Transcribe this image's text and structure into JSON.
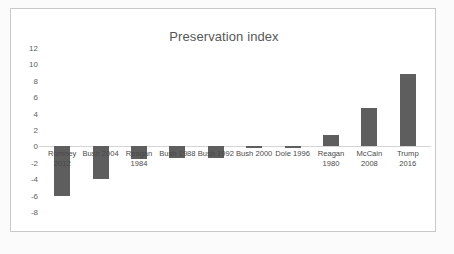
{
  "chart_data": {
    "type": "bar",
    "title": "Preservation index",
    "xlabel": "",
    "ylabel": "",
    "ylim": [
      -8,
      12
    ],
    "ytick_step": 2,
    "yticks": [
      12,
      10,
      8,
      6,
      4,
      2,
      0,
      -2,
      -4,
      -6,
      -8
    ],
    "ytick_labels": [
      "12",
      "10",
      "8",
      "6",
      "4",
      "2",
      "0",
      "-2",
      "-4",
      "-6",
      "-8"
    ],
    "grid": false,
    "legend": false,
    "bar_color": "#5e5e5e",
    "categories": [
      "Romney 2012",
      "Bush 2004",
      "Reagan 1984",
      "Bush 1988",
      "Bush 1992",
      "Bush 2000",
      "Dole 1996",
      "Reagan 1980",
      "McCain 2008",
      "Trump 2016"
    ],
    "category_lines": [
      [
        "Romney",
        "2012"
      ],
      [
        "Bush 2004",
        ""
      ],
      [
        "Reagan",
        "1984"
      ],
      [
        "Bush 1988",
        ""
      ],
      [
        "Bush 1992",
        ""
      ],
      [
        "Bush 2000",
        ""
      ],
      [
        "Dole 1996",
        ""
      ],
      [
        "Reagan",
        "1980"
      ],
      [
        "McCain",
        "2008"
      ],
      [
        "Trump",
        "2016"
      ]
    ],
    "values": [
      -6.1,
      -4.0,
      -1.5,
      -1.4,
      -1.4,
      -0.2,
      -0.2,
      1.4,
      4.7,
      8.8
    ]
  }
}
